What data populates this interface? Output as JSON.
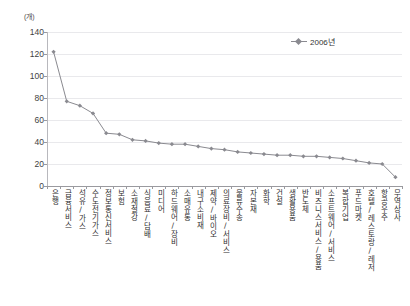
{
  "chart_data": {
    "type": "line",
    "title": "",
    "xlabel": "",
    "ylabel": "(개)",
    "unit_label": "(개)",
    "ylim": [
      0,
      140
    ],
    "ytick_values": [
      0,
      20,
      40,
      60,
      80,
      100,
      120,
      140
    ],
    "ytick_labels": [
      "0",
      "20",
      "40",
      "60",
      "80",
      "100",
      "120",
      "140"
    ],
    "grid": true,
    "legend_position": "top-right",
    "legend": [
      "2006년"
    ],
    "series": [
      {
        "name": "2006년",
        "marker": "diamond",
        "color": "#8a8a90",
        "values": [
          122,
          77,
          73,
          66,
          48,
          47,
          42,
          41,
          39,
          38,
          38,
          36,
          34,
          33,
          31,
          30,
          29,
          28,
          28,
          27,
          27,
          26,
          25,
          23,
          21,
          20,
          8
        ]
      }
    ],
    "categories": [
      "은행",
      "금융서비스",
      "석유/가스",
      "수도전기가스",
      "정보통신서비스",
      "보험",
      "소재철강",
      "식음료/담배",
      "미디어",
      "하드웨어/장비",
      "소매유통",
      "내구소비재",
      "제약/바이오",
      "의료장비/서비스",
      "물류수송",
      "자본재",
      "화학",
      "건설",
      "생활용품",
      "반도체",
      "비즈니스서비스/용품",
      "소프트웨어/서비스",
      "복합기업",
      "푸드마켓",
      "호텔/레스토랑/레저",
      "항공우주",
      "무역상사"
    ]
  }
}
